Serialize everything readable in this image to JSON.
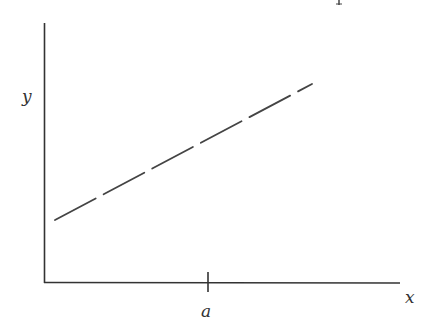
{
  "diagram": {
    "axes": {
      "y_label": "y",
      "x_label": "x",
      "tick_label": "a"
    },
    "colors": {
      "stroke": "#333333",
      "background": "#ffffff"
    },
    "line": {
      "style": "dashed",
      "from": [
        55,
        220
      ],
      "to": [
        312,
        84
      ]
    }
  }
}
